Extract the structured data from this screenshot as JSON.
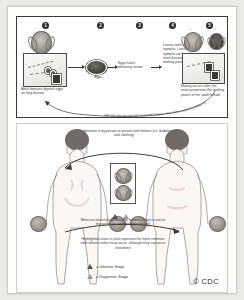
{
  "figure": {
    "copyright": "© CDC"
  },
  "life_cycle": {
    "steps": [
      {
        "number": "1",
        "caption": "Adult females deposit eggs as they burrow"
      },
      {
        "number": "2",
        "caption": "Eggs"
      },
      {
        "number": "3",
        "caption": "Eggs hatch releasing larvae"
      },
      {
        "number": "4",
        "caption": "Larvae molt into nymphs. Larvae and nymphs are found in short burrows called molting pouches"
      },
      {
        "number": "5",
        "caption": "Mating occurs after the male penetrates the molting pouch of the adult female"
      }
    ],
    "curved_caption": "Fertilized females leave their molting pouches and burrow into the skin",
    "labels": {
      "egg_label": "Eggs",
      "female_symbol": "♀",
      "male_symbol": "♂"
    }
  },
  "transmission": {
    "headline": "Transmission is by person to person and fomites (ex. bedding and clothing)",
    "note_sites": "Mites are found predominantly between fingers and on the wrists (areas highlighted in red)",
    "note_rash": "Highlighted areas in pink represent the most common sites where rashes may occur, although they can occur elsewhere"
  },
  "legend": {
    "items": [
      {
        "marker": "triangle-dark",
        "label": "= Infective Stage"
      },
      {
        "marker": "triangle-light",
        "label": "= Diagnostic Stage"
      }
    ]
  },
  "colors": {
    "panel_border": "#3a3a3a",
    "text": "#3d3d3d",
    "page_bg": "#ebebe9",
    "sheet_bg": "#fdfdfc"
  }
}
